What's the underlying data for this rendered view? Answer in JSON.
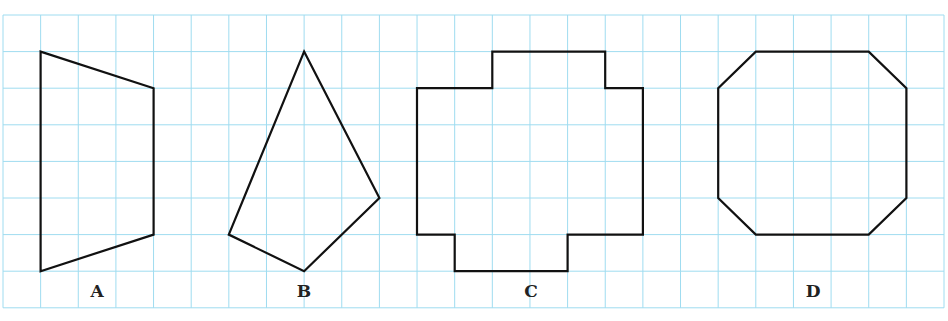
{
  "figure": {
    "grid": {
      "columns": 25,
      "rows": 8,
      "origin_x": 3,
      "origin_y": 15,
      "cell_width": 37.64,
      "cell_height": 36.6,
      "line_color": "#9fdcf0"
    },
    "stroke_color": "#111111",
    "shapes": [
      {
        "label": "A",
        "type": "trapezoid",
        "vertices_grid": [
          [
            1,
            1
          ],
          [
            4,
            2
          ],
          [
            4,
            6
          ],
          [
            1,
            7
          ]
        ]
      },
      {
        "label": "B",
        "type": "kite-like quadrilateral",
        "vertices_grid": [
          [
            8,
            1
          ],
          [
            10,
            5
          ],
          [
            8,
            7
          ],
          [
            6,
            6
          ]
        ]
      },
      {
        "label": "C",
        "type": "rectilinear polygon",
        "vertices_grid": [
          [
            11,
            2
          ],
          [
            13,
            2
          ],
          [
            13,
            1
          ],
          [
            16,
            1
          ],
          [
            16,
            2
          ],
          [
            17,
            2
          ],
          [
            17,
            6
          ],
          [
            15,
            6
          ],
          [
            15,
            7
          ],
          [
            12,
            7
          ],
          [
            12,
            6
          ],
          [
            11,
            6
          ]
        ]
      },
      {
        "label": "D",
        "type": "octagon",
        "vertices_grid": [
          [
            20,
            1
          ],
          [
            23,
            1
          ],
          [
            24,
            2
          ],
          [
            24,
            5
          ],
          [
            23,
            6
          ],
          [
            20,
            6
          ],
          [
            19,
            5
          ],
          [
            19,
            2
          ]
        ]
      }
    ],
    "labels": [
      {
        "text": "A",
        "x": 97,
        "y": 297
      },
      {
        "text": "B",
        "x": 304,
        "y": 297
      },
      {
        "text": "C",
        "x": 531,
        "y": 297
      },
      {
        "text": "D",
        "x": 813,
        "y": 297
      }
    ]
  }
}
